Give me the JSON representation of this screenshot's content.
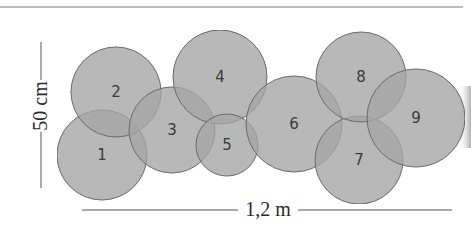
{
  "diagram": {
    "type": "overlapping-circles-layout",
    "colors": {
      "fill": "#a3a3a3",
      "stroke": "#5f5f5f",
      "label": "#3a3a3a",
      "rule": "#7a7a7a",
      "dimension_line": "#555555"
    },
    "circles": [
      {
        "label": "1",
        "cx": 102,
        "cy": 155,
        "r": 45
      },
      {
        "label": "2",
        "cx": 116,
        "cy": 92,
        "r": 45
      },
      {
        "label": "3",
        "cx": 172,
        "cy": 130,
        "r": 43
      },
      {
        "label": "4",
        "cx": 220,
        "cy": 77,
        "r": 47
      },
      {
        "label": "5",
        "cx": 227,
        "cy": 145,
        "r": 31
      },
      {
        "label": "6",
        "cx": 294,
        "cy": 124,
        "r": 48
      },
      {
        "label": "7",
        "cx": 359,
        "cy": 160,
        "r": 44
      },
      {
        "label": "8",
        "cx": 361,
        "cy": 77,
        "r": 45
      },
      {
        "label": "9",
        "cx": 416,
        "cy": 118,
        "r": 49
      }
    ],
    "dimensions": {
      "height_label": "50 cm",
      "width_label": "1,2 m"
    }
  }
}
